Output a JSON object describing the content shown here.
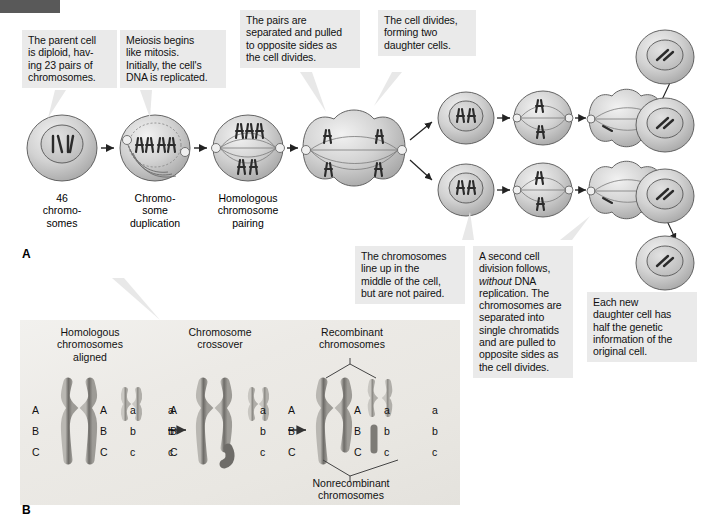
{
  "figure": {
    "panels": [
      {
        "letter": "A",
        "name": "meiosis-stages"
      },
      {
        "letter": "B",
        "name": "crossing-over"
      }
    ]
  },
  "panelA": {
    "letter": "A",
    "callouts": [
      {
        "id": "parent-cell",
        "text": "The parent cell is diploid, hav-ing 23 pairs of chromosomes.",
        "lines": [
          "The parent cell",
          "is diploid, hav-",
          "ing 23 pairs of",
          "chromosomes."
        ]
      },
      {
        "id": "meiosis-begins",
        "text": "Meiosis begins like mitosis. Initially, the cell's DNA is replicated.",
        "lines": [
          "Meiosis begins",
          "like mitosis.",
          "Initially, the cell's",
          "DNA is replicated."
        ]
      },
      {
        "id": "pairs-separated",
        "text": "The pairs are separated and pulled to opposite sides as the cell divides.",
        "lines": [
          "The pairs are",
          "separated and pulled",
          "to opposite sides as",
          "the cell divides."
        ]
      },
      {
        "id": "cell-divides",
        "text": "The cell divides, forming two daughter cells.",
        "lines": [
          "The cell divides,",
          "forming two",
          "daughter cells."
        ]
      },
      {
        "id": "chromosomes-line-up",
        "text": "The chromosomes line up in the middle of the cell, but are not paired.",
        "lines": [
          "The chromosomes",
          "line up in the",
          "middle of the cell,",
          "but are not paired."
        ]
      },
      {
        "id": "second-division",
        "text": "A second cell division follows, without DNA replication. The chromosomes are separated into single chromatids and are pulled to opposite sides as the cell divides.",
        "lines": [
          "A second cell",
          "division follows,",
          "without DNA",
          "replication. The",
          "chromosomes are",
          "separated into",
          "single chromatids",
          "and are pulled to",
          "opposite sides as",
          "the cell divides."
        ],
        "italic_word": "without"
      },
      {
        "id": "each-new-daughter",
        "text": "Each new daughter cell has half the genetic information of the original cell.",
        "lines": [
          "Each new",
          "daughter cell has",
          "half the genetic",
          "information of the",
          "original cell."
        ]
      }
    ],
    "cell_labels": [
      {
        "id": "label-46-chromosomes",
        "lines": [
          "46",
          "chromo-",
          "somes"
        ]
      },
      {
        "id": "label-chromosome-duplication",
        "lines": [
          "Chromo-",
          "some",
          "duplication"
        ]
      },
      {
        "id": "label-homologous-pairing",
        "lines": [
          "Homologous",
          "chromosome",
          "pairing"
        ]
      }
    ]
  },
  "panelB": {
    "letter": "B",
    "headings": [
      {
        "id": "heading-homologous-aligned",
        "lines": [
          "Homologous",
          "chromosomes",
          "aligned"
        ]
      },
      {
        "id": "heading-chromosome-crossover",
        "lines": [
          "Chromosome",
          "crossover"
        ]
      },
      {
        "id": "heading-recombinant",
        "lines": [
          "Recombinant",
          "chromosomes"
        ]
      }
    ],
    "caption": {
      "id": "caption-nonrecombinant",
      "lines": [
        "Nonrecombinant",
        "chromosomes"
      ]
    },
    "allele_columns": [
      {
        "id": "stage1-col1",
        "letters": [
          "A",
          "B",
          "C"
        ]
      },
      {
        "id": "stage1-col2",
        "letters": [
          "A",
          "B",
          "C"
        ]
      },
      {
        "id": "stage1-col3",
        "letters": [
          "a",
          "b",
          "c"
        ]
      },
      {
        "id": "stage1-col4",
        "letters": [
          "a",
          "b",
          "c"
        ]
      },
      {
        "id": "stage2-col1",
        "letters": [
          "A",
          "B",
          "C"
        ]
      },
      {
        "id": "stage2-col2",
        "letters": [
          "a",
          "b",
          "c"
        ]
      },
      {
        "id": "stage3-col1",
        "letters": [
          "A",
          "B",
          "C"
        ]
      },
      {
        "id": "stage3-col2",
        "letters": [
          "A",
          "B",
          "C"
        ]
      },
      {
        "id": "stage3-col3",
        "letters": [
          "a",
          "b",
          "c"
        ]
      },
      {
        "id": "stage3-col4",
        "letters": [
          "a",
          "b",
          "c"
        ]
      }
    ],
    "arrows": [
      "→",
      "→"
    ]
  },
  "colors": {
    "callout_bg": "#eaeaea",
    "corner_bar": "#595959",
    "plate_bg": "#eeece8",
    "cell_fill": "#cfcfcf",
    "chromosome": "#2b2b2b",
    "text": "#111111"
  }
}
